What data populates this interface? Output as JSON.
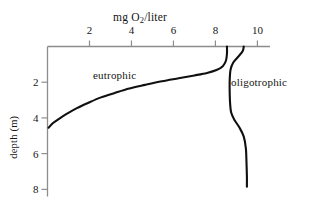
{
  "chart_data": {
    "type": "line",
    "title": "mg O2/liter",
    "title_parts": {
      "pre": "mg O",
      "sub": "2",
      "post": "/liter"
    },
    "xlabel": "mg O2/liter",
    "ylabel": "depth (m)",
    "x_axis_position": "top",
    "y_axis_inverted": true,
    "xlim": [
      0,
      10.6
    ],
    "ylim": [
      0,
      8.4
    ],
    "xticks": [
      2,
      4,
      6,
      8,
      10
    ],
    "xtick_labels": [
      "2",
      "4",
      "6",
      "8",
      "10"
    ],
    "yticks": [
      2,
      4,
      6,
      8
    ],
    "ytick_labels": [
      "2",
      "4",
      "6",
      "8"
    ],
    "grid": false,
    "legend": "inline-annotations",
    "line_color": "#101010",
    "axis_color": "#8d8d8d",
    "series": [
      {
        "name": "eutrophic",
        "label_position": "inside-left",
        "points": [
          [
            0.05,
            4.55
          ],
          [
            0.25,
            4.3
          ],
          [
            0.55,
            4.05
          ],
          [
            0.95,
            3.75
          ],
          [
            1.4,
            3.45
          ],
          [
            1.95,
            3.15
          ],
          [
            2.55,
            2.85
          ],
          [
            3.2,
            2.6
          ],
          [
            3.9,
            2.35
          ],
          [
            4.65,
            2.15
          ],
          [
            5.45,
            1.95
          ],
          [
            6.25,
            1.78
          ],
          [
            7.0,
            1.62
          ],
          [
            7.6,
            1.48
          ],
          [
            8.05,
            1.32
          ],
          [
            8.35,
            1.1
          ],
          [
            8.5,
            0.8
          ],
          [
            8.55,
            0.4
          ],
          [
            8.55,
            0.0
          ]
        ]
      },
      {
        "name": "oligotrophic",
        "label_position": "right",
        "points": [
          [
            9.35,
            0.0
          ],
          [
            9.3,
            0.25
          ],
          [
            9.1,
            0.55
          ],
          [
            8.85,
            0.9
          ],
          [
            8.72,
            1.3
          ],
          [
            8.68,
            1.9
          ],
          [
            8.68,
            2.6
          ],
          [
            8.7,
            3.2
          ],
          [
            8.75,
            3.7
          ],
          [
            8.9,
            4.1
          ],
          [
            9.15,
            4.55
          ],
          [
            9.35,
            5.05
          ],
          [
            9.45,
            5.7
          ],
          [
            9.48,
            6.5
          ],
          [
            9.5,
            7.3
          ],
          [
            9.5,
            7.85
          ]
        ]
      }
    ],
    "annotations": [
      {
        "text": "eutrophic",
        "x": 2.6,
        "y": 1.55
      },
      {
        "text": "oligotrophic",
        "x": 9.6,
        "y": 1.85
      }
    ]
  }
}
